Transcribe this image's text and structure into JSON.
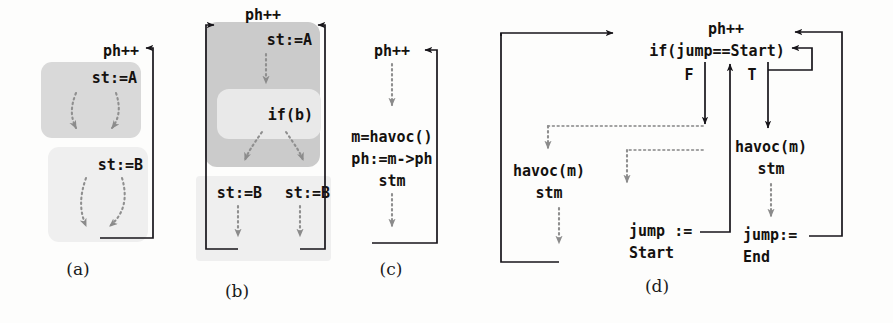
{
  "figure": {
    "background": "#fdfdfc",
    "colors": {
      "ink": "#17151a",
      "dotted_gray": "#8f8f8f",
      "box_dark": "#cbcbcb",
      "box_mid": "#d9d9d9",
      "box_light": "#e9e9e9",
      "box_pale": "#efefef"
    }
  },
  "panels": [
    {
      "id": "a",
      "caption": "(a)",
      "loop_label": "ph++",
      "blocks": [
        {
          "label": "st:=A",
          "shade": "box_mid"
        },
        {
          "label": "st:=B",
          "shade": "box_pale"
        }
      ],
      "edges": {
        "dotted": 4,
        "solid_backedge": 1
      }
    },
    {
      "id": "b",
      "caption": "(b)",
      "loop_label": "ph++",
      "blocks": [
        {
          "label": "st:=A",
          "shade": "box_mid"
        },
        {
          "label": "if(b)",
          "shade": "box_light"
        },
        {
          "label": "st:=B",
          "shade": "box_pale"
        },
        {
          "label": "st:=B",
          "shade": "box_pale"
        }
      ],
      "edges": {
        "dotted": 5,
        "solid_backedge": 2
      }
    },
    {
      "id": "c",
      "caption": "(c)",
      "loop_label": "ph++",
      "body": [
        "m=havoc()",
        "ph:=m->ph",
        "stm"
      ],
      "edges": {
        "dotted": 2,
        "solid_backedge": 1
      }
    },
    {
      "id": "d",
      "caption": "(d)",
      "header": [
        "ph++",
        "if(jump==Start)"
      ],
      "branch_labels": {
        "false": "F",
        "true": "T"
      },
      "blocks": [
        {
          "label_lines": [
            "havoc(m)",
            "stm"
          ],
          "side": "left"
        },
        {
          "label_lines": [
            "jump :=",
            "Start"
          ],
          "side": "left-lower"
        },
        {
          "label_lines": [
            "havoc(m)",
            "stm"
          ],
          "side": "right"
        },
        {
          "label_lines": [
            "jump:=",
            "End"
          ],
          "side": "right-lower"
        }
      ],
      "edges": {
        "dotted": 4,
        "solid": 5
      }
    }
  ]
}
